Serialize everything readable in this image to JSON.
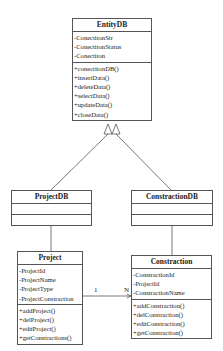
{
  "classes": {
    "entitydb": {
      "name": "EntityDB",
      "attributes": [
        "-ConectitonStr",
        "-ConectitonStatus",
        "-Conectiton"
      ],
      "methods": [
        "+conectitonDB()",
        "+insertData()",
        "+deleteData()",
        "+selectData()",
        "+updateData()",
        "+closeData()"
      ]
    },
    "projectdb": {
      "name": "ProjectDB",
      "attributes": [],
      "methods": []
    },
    "constractiondb": {
      "name": "ConstractionDB",
      "attributes": [],
      "methods": []
    },
    "project": {
      "name": "Project",
      "attributes": [
        "-ProjectId",
        "-ProjectName",
        "-ProjectType",
        "-ProjectConstraction"
      ],
      "methods": [
        "+addProject()",
        "+delProject()",
        "+editProject()",
        "+getConstractions()"
      ]
    },
    "constraction": {
      "name": "Constraction",
      "attributes": [
        "-ConstractionId",
        "-ProjectId",
        "-ConstractionName"
      ],
      "methods": [
        "+addConstraction()",
        "+delConstraction()",
        "+editConstraction()",
        "+getConstraction()"
      ]
    }
  },
  "relationships": {
    "association": {
      "source_multiplicity": "1",
      "target_multiplicity": "N"
    }
  }
}
